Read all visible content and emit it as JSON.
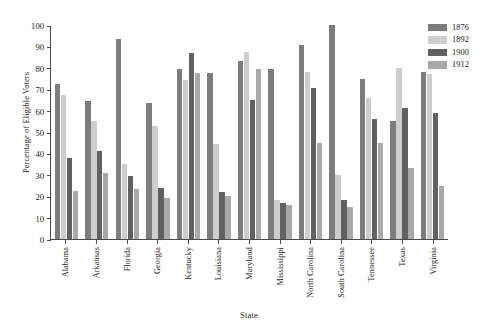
{
  "chart_data": {
    "type": "bar",
    "title": "",
    "xlabel": "State",
    "ylabel": "Percentage of Eligible Voters",
    "ylim": [
      0,
      100
    ],
    "yticks": [
      0,
      10,
      20,
      30,
      40,
      50,
      60,
      70,
      80,
      90,
      100
    ],
    "grid": false,
    "legend_position": "top-right",
    "categories": [
      "Alabama",
      "Arkansas",
      "Florida",
      "Georgia",
      "Kentucky",
      "Louisiana",
      "Maryland",
      "Mississippi",
      "North Carolina",
      "South Carolina",
      "Tennessee",
      "Texas",
      "Virginia"
    ],
    "series": [
      {
        "name": "1876",
        "color": "#7d7d7d",
        "values": [
          72.5,
          64.5,
          93.5,
          63.5,
          79.5,
          77.5,
          83.0,
          79.5,
          90.5,
          100.0,
          75.0,
          55.0,
          78.0
        ]
      },
      {
        "name": "1892",
        "color": "#cdcdcd",
        "values": [
          67.5,
          55.0,
          35.0,
          53.0,
          74.5,
          44.5,
          87.5,
          18.0,
          78.0,
          30.0,
          66.0,
          80.0,
          77.0
        ]
      },
      {
        "name": "1900",
        "color": "#616161",
        "values": [
          38.0,
          41.0,
          29.5,
          24.0,
          87.0,
          22.0,
          65.0,
          17.0,
          70.5,
          18.0,
          56.0,
          61.0,
          59.0
        ]
      },
      {
        "name": "1912",
        "color": "#a9a9a9",
        "values": [
          22.5,
          31.0,
          23.5,
          19.0,
          77.5,
          20.0,
          79.5,
          16.0,
          45.0,
          15.0,
          45.0,
          33.0,
          25.0
        ]
      }
    ]
  }
}
